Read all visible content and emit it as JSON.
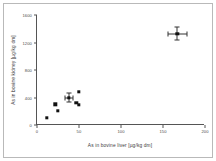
{
  "chart_data": {
    "type": "scatter",
    "title": "",
    "xlabel": "As in bovine liver [µg/kg dm]",
    "ylabel": "As in bovine kidney [µg/kg dm]",
    "xlim": [
      0,
      200
    ],
    "ylim": [
      0,
      1600
    ],
    "xticks": [
      0,
      50,
      100,
      150,
      200
    ],
    "yticks": [
      0,
      400,
      800,
      1200,
      1600
    ],
    "xticklabels": [
      "0",
      "50",
      "100",
      "150",
      "200"
    ],
    "yticklabels": [
      "0",
      "400",
      "800",
      "1200",
      "1600"
    ],
    "grid": false,
    "legend": null,
    "marker": "filled-square",
    "marker_color": "#111111",
    "points": [
      {
        "x": 12,
        "y": 105,
        "xerr": 0,
        "yerr": 0
      },
      {
        "x": 22,
        "y": 300,
        "xerr": 0,
        "yerr": 0
      },
      {
        "x": 25,
        "y": 205,
        "xerr": 0,
        "yerr": 0
      },
      {
        "x": 38,
        "y": 400,
        "xerr": 5,
        "yerr": 70
      },
      {
        "x": 47,
        "y": 320,
        "xerr": 0,
        "yerr": 0
      },
      {
        "x": 50,
        "y": 290,
        "xerr": 0,
        "yerr": 0
      },
      {
        "x": 50,
        "y": 480,
        "xerr": 0,
        "yerr": 0
      },
      {
        "x": 167,
        "y": 1330,
        "xerr": 11,
        "yerr": 90
      }
    ]
  }
}
